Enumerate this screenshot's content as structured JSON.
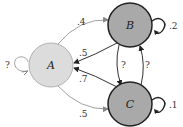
{
  "diagram": {
    "type": "markov-chain",
    "nodes": [
      {
        "id": "A",
        "label": "A",
        "fill": "#dcdcdc",
        "stroke": "#b0b0b0"
      },
      {
        "id": "B",
        "label": "B",
        "fill": "#a9a9a9",
        "stroke": "#222222"
      },
      {
        "id": "C",
        "label": "C",
        "fill": "#a9a9a9",
        "stroke": "#222222"
      }
    ],
    "edges": [
      {
        "from": "A",
        "to": "B",
        "label": ".4",
        "color": "#9a9a9a"
      },
      {
        "from": "B",
        "to": "A",
        "label": ".5",
        "color": "#333333"
      },
      {
        "from": "C",
        "to": "A",
        "label": ".7",
        "color": "#333333"
      },
      {
        "from": "A",
        "to": "C",
        "label": ".5",
        "color": "#9a9a9a"
      },
      {
        "from": "B",
        "to": "C",
        "label": "?",
        "color": "#333333"
      },
      {
        "from": "C",
        "to": "B",
        "label": "?",
        "color": "#333333"
      },
      {
        "from": "A",
        "to": "A",
        "label": "?",
        "color": "#9a9a9a"
      },
      {
        "from": "B",
        "to": "B",
        "label": ".2",
        "color": "#222222"
      },
      {
        "from": "C",
        "to": "C",
        "label": ".1",
        "color": "#222222"
      }
    ]
  }
}
